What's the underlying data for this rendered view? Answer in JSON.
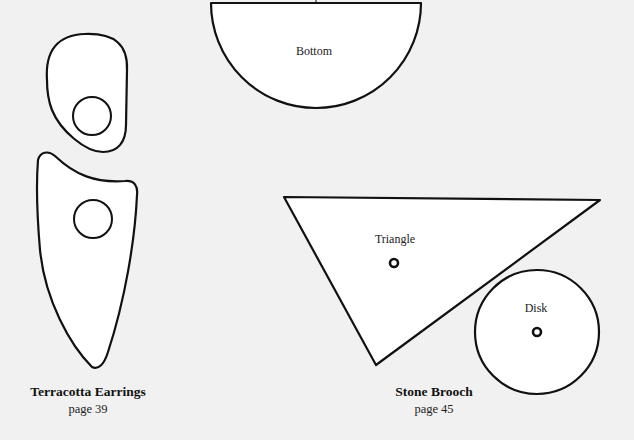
{
  "patterns": {
    "earrings": {
      "title": "Terracotta Earrings",
      "page": "page 39",
      "pieces": [
        "top-drop",
        "bottom-drop"
      ]
    },
    "brooch": {
      "title": "Stone Brooch",
      "page": "page 45",
      "pieces": [
        {
          "id": "triangle",
          "label": "Triangle"
        },
        {
          "id": "disk",
          "label": "Disk"
        }
      ]
    },
    "bottom_piece": {
      "label": "Bottom"
    }
  },
  "colors": {
    "background": "#f1f1f1",
    "shape_fill": "#ffffff",
    "outline": "#111111"
  }
}
